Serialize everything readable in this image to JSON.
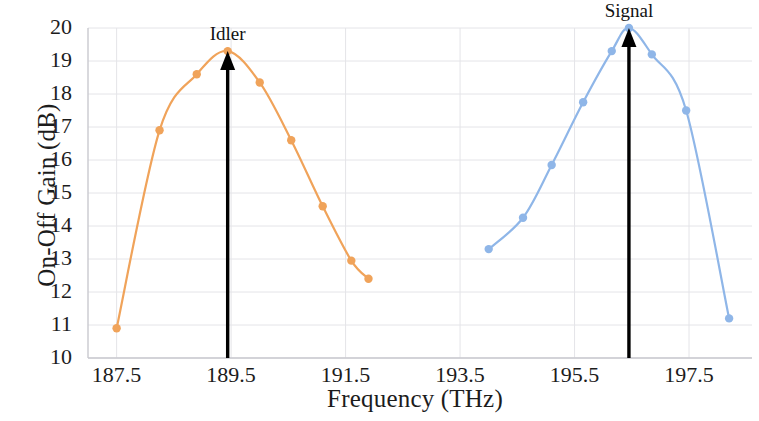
{
  "chart_data": {
    "type": "line",
    "title": "",
    "xlabel": "Frequency  (THz)",
    "ylabel": "On-Off Gain  (dB)",
    "xlim": [
      187.0,
      198.6
    ],
    "ylim": [
      10,
      20
    ],
    "xticks": [
      "187.5",
      "189.5",
      "191.5",
      "193.5",
      "195.5",
      "197.5"
    ],
    "xtick_values": [
      187.5,
      189.5,
      191.5,
      193.5,
      195.5,
      197.5
    ],
    "yticks": [
      "10",
      "11",
      "12",
      "13",
      "14",
      "15",
      "16",
      "17",
      "18",
      "19",
      "20"
    ],
    "ytick_values": [
      10,
      11,
      12,
      13,
      14,
      15,
      16,
      17,
      18,
      19,
      20
    ],
    "grid": true,
    "legend": "none",
    "series": [
      {
        "name": "Idler",
        "color": "#F0A35A",
        "marker": "circle",
        "x": [
          187.5,
          188.25,
          188.9,
          189.44,
          190.0,
          190.55,
          191.1,
          191.6,
          191.9
        ],
        "y": [
          10.9,
          16.9,
          18.6,
          19.3,
          18.35,
          16.6,
          14.6,
          12.95,
          12.4
        ]
      },
      {
        "name": "Signal",
        "color": "#8FB6E8",
        "marker": "circle",
        "x": [
          194.0,
          194.6,
          195.1,
          195.65,
          196.15,
          196.45,
          196.85,
          197.45,
          198.2
        ],
        "y": [
          13.3,
          14.25,
          15.85,
          17.75,
          19.3,
          20.0,
          19.2,
          17.5,
          11.2
        ]
      }
    ],
    "annotations": [
      {
        "label": "Idler",
        "x": 189.44,
        "y": 19.3,
        "arrow": "up",
        "arrow_base_y": 10.0,
        "color": "#000000"
      },
      {
        "label": "Signal",
        "x": 196.45,
        "y": 20.0,
        "arrow": "up",
        "arrow_base_y": 10.0,
        "color": "#000000"
      }
    ]
  },
  "axis_style": {
    "grid_color": "#E4E4E8",
    "axis_color": "#C9C9CF",
    "text_color": "#1c1c1c"
  }
}
